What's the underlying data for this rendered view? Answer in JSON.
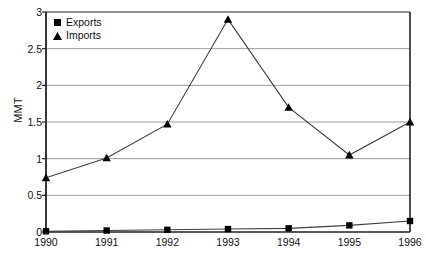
{
  "chart_data": {
    "type": "line",
    "title": "",
    "xlabel": "",
    "ylabel": "MMT",
    "categories": [
      "1990",
      "1991",
      "1992",
      "1993",
      "1994",
      "1995",
      "1996"
    ],
    "x": [
      1990,
      1991,
      1992,
      1993,
      1994,
      1995,
      1996
    ],
    "series": [
      {
        "name": "Exports",
        "marker": "square",
        "color": "#000000",
        "values": [
          0.01,
          0.02,
          0.03,
          0.04,
          0.05,
          0.09,
          0.15
        ]
      },
      {
        "name": "Imports",
        "marker": "triangle",
        "color": "#000000",
        "values": [
          0.74,
          1.01,
          1.47,
          2.9,
          1.7,
          1.05,
          1.5
        ]
      }
    ],
    "ylim": [
      0,
      3
    ],
    "yticks": [
      0,
      0.5,
      1,
      1.5,
      2,
      2.5,
      3
    ],
    "ytick_labels": [
      "0",
      "0.5",
      "1",
      "1.5",
      "2",
      "2.5",
      "3"
    ],
    "grid": true,
    "grid_axis": "y",
    "legend_position": "top-left",
    "legend_entries": [
      "Exports",
      "Imports"
    ]
  },
  "colors": {
    "line": "#3f3f3f",
    "marker": "#000000",
    "grid": "#9a9a9a",
    "axis": "#222222",
    "text": "#111111",
    "background": "#ffffff"
  }
}
